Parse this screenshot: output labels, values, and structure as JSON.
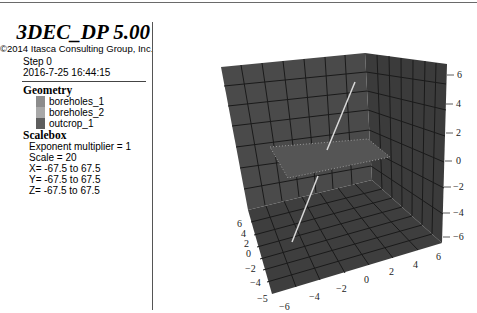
{
  "header": {
    "title": "3DEC_DP 5.00",
    "copyright": "©2014 Itasca Consulting Group, Inc.",
    "step": "Step 0",
    "datetime": "2016-7-25 16:44:15"
  },
  "legend": {
    "geometry_heading": "Geometry",
    "geometry_items": [
      {
        "label": "boreholes_1",
        "color": "#8c8c8c"
      },
      {
        "label": "boreholes_2",
        "color": "#a8a8a8"
      },
      {
        "label": "outcrop_1",
        "color": "#5e5e5e"
      }
    ],
    "scalebox_heading": "Scalebox",
    "scalebox_lines": [
      "Exponent multiplier = 1",
      "Scale = 20",
      "X= -67.5 to 67.5",
      "Y= -67.5 to 67.5",
      "Z= -67.5 to 67.5"
    ]
  },
  "view": {
    "colors": {
      "back_wall": "#4a4a4a",
      "side_wall": "#3b3b3b",
      "floor": "#3e3e3e",
      "grid": "#1a1a1a",
      "plane": "#555555",
      "borehole": "#d8d8d8"
    },
    "z_axis_ticks": [
      "6",
      "4",
      "2",
      "0",
      "−2",
      "−4",
      "−6"
    ],
    "y_axis_ticks": [
      "6",
      "4",
      "2",
      "0",
      "−2",
      "−4",
      "−5"
    ],
    "x_axis_ticks": [
      "−6",
      "−4",
      "−2",
      "0",
      "2",
      "4",
      "6"
    ]
  }
}
